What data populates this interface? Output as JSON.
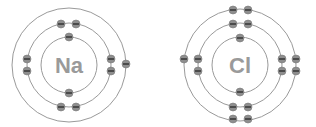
{
  "diagram": {
    "title": "",
    "atoms": [
      {
        "symbol": "Na",
        "center": [
          69,
          65
        ],
        "shells": [
          {
            "radius": 28,
            "electrons": 2
          },
          {
            "radius": 42,
            "electrons": 8
          },
          {
            "radius": 57,
            "electrons": 1
          }
        ]
      },
      {
        "symbol": "Cl",
        "center": [
          240,
          65
        ],
        "shells": [
          {
            "radius": 28,
            "electrons": 2
          },
          {
            "radius": 42,
            "electrons": 8
          },
          {
            "radius": 56,
            "electrons": 7
          }
        ]
      }
    ],
    "colors": {
      "ring": "#9a9a9a",
      "electron": "#8e8e8e",
      "symbol": "#9a9a9a"
    }
  }
}
